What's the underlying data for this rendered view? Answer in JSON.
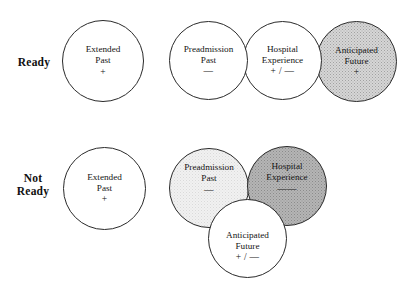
{
  "figure": {
    "background_color": "#ffffff",
    "outline_color": "#2a2a2a"
  },
  "rows": [
    {
      "key": "ready",
      "label": "Ready",
      "left_circle": {
        "name": "extended-past",
        "title_lines": [
          "Extended",
          "Past"
        ],
        "symbol": "+",
        "fill": "white",
        "fill_color": "#ffffff"
      },
      "cluster": [
        {
          "name": "preadmission-past",
          "title_lines": [
            "Preadmission",
            "Past"
          ],
          "symbol": "—",
          "fill": "white",
          "fill_color": "#ffffff"
        },
        {
          "name": "hospital-experience",
          "title_lines": [
            "Hospital",
            "Experience"
          ],
          "symbol": "+ / —",
          "fill": "white",
          "fill_color": "#ffffff"
        },
        {
          "name": "anticipated-future",
          "title_lines": [
            "Anticipated",
            "Future"
          ],
          "symbol": "+",
          "fill": "medium",
          "fill_color": "#d6d6d6"
        }
      ]
    },
    {
      "key": "not_ready",
      "label": "Not\nReady",
      "left_circle": {
        "name": "extended-past",
        "title_lines": [
          "Extended",
          "Past"
        ],
        "symbol": "+",
        "fill": "white",
        "fill_color": "#ffffff"
      },
      "cluster": [
        {
          "name": "preadmission-past",
          "title_lines": [
            "Preadmission",
            "Past"
          ],
          "symbol": "—",
          "fill": "light",
          "fill_color": "#f1f1f1"
        },
        {
          "name": "hospital-experience",
          "title_lines": [
            "Hospital",
            "Experience"
          ],
          "symbol": "——",
          "fill": "dark",
          "fill_color": "#b5b5b5"
        },
        {
          "name": "anticipated-future",
          "title_lines": [
            "Anticipated",
            "Future"
          ],
          "symbol": "+ / —",
          "fill": "white",
          "fill_color": "#ffffff"
        }
      ]
    }
  ]
}
